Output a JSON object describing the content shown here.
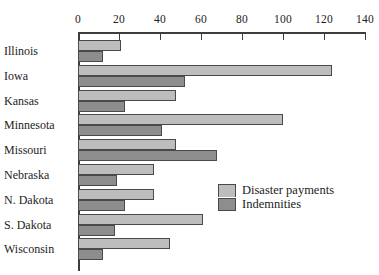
{
  "chart_data": {
    "type": "bar",
    "orientation": "horizontal",
    "title": "",
    "subtitle": "",
    "xlabel": "",
    "ylabel": "",
    "xlim": [
      0,
      140
    ],
    "xticks": [
      0,
      20,
      40,
      60,
      80,
      100,
      120,
      140
    ],
    "xtick_labels": [
      "0",
      "20",
      "40",
      "60",
      "80",
      "100",
      "120",
      "140"
    ],
    "grid": false,
    "axis_position": "top",
    "categories": [
      "Illinois",
      "Iowa",
      "Kansas",
      "Minnesota",
      "Missouri",
      "Nebraska",
      "N. Dakota",
      "S. Dakota",
      "Wisconsin"
    ],
    "series": [
      {
        "name": "Disaster payments",
        "color": "#bdbdbd",
        "values": [
          21,
          124,
          48,
          100,
          48,
          37,
          37,
          61,
          45
        ]
      },
      {
        "name": "Indemnities",
        "color": "#8d8d8d",
        "values": [
          12,
          52,
          23,
          41,
          68,
          19,
          23,
          18,
          12
        ]
      }
    ],
    "legend": {
      "position": "inside-right",
      "entries": [
        {
          "label": "Disaster payments",
          "color": "#bdbdbd"
        },
        {
          "label": "Indemnities",
          "color": "#8d8d8d"
        }
      ]
    }
  },
  "colors": {
    "light_bar": "#bdbdbd",
    "dark_bar": "#8d8d8d",
    "axis": "#3d3d3d",
    "bar_border": "#4a4a4a",
    "text": "#1d1d1d",
    "background": "#ffffff"
  }
}
